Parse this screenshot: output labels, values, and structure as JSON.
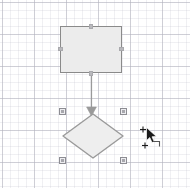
{
  "canvas": {
    "name": "diagram-canvas",
    "width": 190,
    "height": 188,
    "background_color": "#ffffff",
    "grid": {
      "visible": true,
      "minor_spacing_px": 8,
      "major_spacing_px": 32,
      "minor_color": "#cdcdd7",
      "major_color": "#b4b4be"
    }
  },
  "shapes": [
    {
      "id": "rect-1",
      "type": "rectangle",
      "label": "",
      "x": 60,
      "y": 26,
      "width": 62,
      "height": 47,
      "fill_color": "#ececec",
      "stroke_color": "#8a8a8a",
      "selected": false,
      "hovered": true,
      "connection_points": 4
    },
    {
      "id": "diamond-1",
      "type": "diamond",
      "label": "",
      "x": 62,
      "y": 113,
      "width": 62,
      "height": 46,
      "fill_color": "#eeeeee",
      "stroke_color": "#9a9a9a",
      "selected": true,
      "hovered": false,
      "handle_count": 4
    }
  ],
  "connectors": [
    {
      "id": "edge-1",
      "type": "arrow",
      "from": "rect-1",
      "to": "diamond-1",
      "stroke_color": "#9a9a9a",
      "arrowhead": "filled-triangle",
      "start_x": 91,
      "start_y": 73,
      "end_x": 91,
      "end_y": 113
    }
  ],
  "selection": {
    "handles": [
      {
        "name": "handle-top-left",
        "x": 59,
        "y": 108
      },
      {
        "name": "handle-top-right",
        "x": 120,
        "y": 108
      },
      {
        "name": "handle-bottom-left",
        "x": 59,
        "y": 157
      },
      {
        "name": "handle-bottom-right",
        "x": 120,
        "y": 157
      }
    ],
    "handle_fill": "#a7a7ad",
    "handle_border": "#8d8d93"
  },
  "cursor": {
    "name": "draw-connection-cursor",
    "type": "arrow-with-crosshair",
    "x": 139,
    "y": 125,
    "color": "#1a1a1a"
  }
}
